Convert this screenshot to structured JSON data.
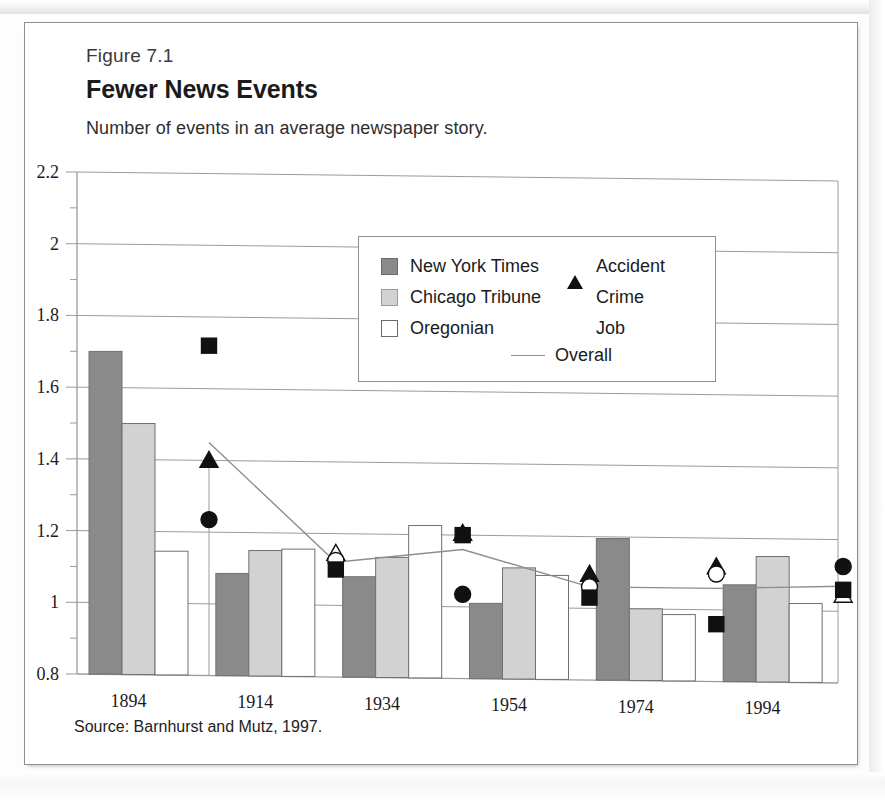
{
  "page": {
    "corner_number": ""
  },
  "figure": {
    "label": "Figure 7.1",
    "title": "Fewer News Events",
    "subtitle": "Number of events in an average newspaper story.",
    "source": "Source: Barnhurst and Mutz, 1997."
  },
  "legend": {
    "items": [
      {
        "label": "New York Times",
        "icon": "square-swatch-dark-gray",
        "color": "#8a8a8a"
      },
      {
        "label": "Chicago Tribune",
        "icon": "square-swatch-light-gray",
        "color": "#d2d2d2"
      },
      {
        "label": "Oregonian",
        "icon": "square-swatch-white",
        "color": "#ffffff"
      },
      {
        "label": "Accident",
        "icon": "triangle-marker",
        "color": "#111111"
      },
      {
        "label": "Crime",
        "icon": "circle-marker",
        "color": "#111111"
      },
      {
        "label": "Job",
        "icon": "square-marker",
        "color": "#111111"
      },
      {
        "label": "Overall",
        "icon": "line-marker",
        "color": "#8d8d8d"
      }
    ]
  },
  "chart_data": {
    "type": "bar",
    "title": "Fewer News Events",
    "subtitle": "Number of events in an average newspaper story.",
    "xlabel": "",
    "ylabel": "",
    "ylim": [
      0.8,
      2.2
    ],
    "ytick_step": 0.2,
    "yticks": [
      "0.8",
      "1",
      "1.2",
      "1.4",
      "1.6",
      "1.8",
      "2",
      "2.2"
    ],
    "ytick_values": [
      0.8,
      1.0,
      1.2,
      1.4,
      1.6,
      1.8,
      2.0,
      2.2
    ],
    "minor_tick_step": 0.1,
    "grid": "horizontal",
    "legend_position": "inside-top-center",
    "categories": [
      "1894",
      "1914",
      "1934",
      "1954",
      "1974",
      "1994"
    ],
    "series": [
      {
        "name": "New York Times",
        "type": "bar",
        "color": "#8a8a8a",
        "values": [
          1.7,
          1.085,
          1.08,
          1.01,
          1.195,
          1.07
        ]
      },
      {
        "name": "Chicago Tribune",
        "type": "bar",
        "color": "#d2d2d2",
        "values": [
          1.5,
          1.15,
          1.135,
          1.11,
          1.0,
          1.15
        ]
      },
      {
        "name": "Oregonian",
        "type": "bar",
        "color": "#ffffff",
        "values": [
          1.145,
          1.155,
          1.225,
          1.09,
          0.985,
          1.02
        ]
      },
      {
        "name": "Accident",
        "type": "marker",
        "marker": "triangle",
        "filled": [
          true,
          false,
          true,
          true,
          true,
          false
        ],
        "values": [
          1.4,
          1.145,
          1.205,
          1.095,
          1.12,
          1.045
        ]
      },
      {
        "name": "Crime",
        "type": "marker",
        "marker": "circle",
        "filled": [
          true,
          false,
          true,
          false,
          false,
          true
        ],
        "values": [
          1.235,
          1.125,
          1.035,
          1.06,
          1.1,
          1.125
        ]
      },
      {
        "name": "Job",
        "type": "marker",
        "marker": "square",
        "filled": [
          true,
          true,
          true,
          true,
          true,
          true
        ],
        "values": [
          1.72,
          1.1,
          1.2,
          1.03,
          0.96,
          1.06
        ]
      },
      {
        "name": "Overall",
        "type": "line",
        "color": "#8d8d8d",
        "values": [
          1.45,
          1.12,
          1.16,
          1.06,
          1.06,
          1.07
        ]
      }
    ]
  }
}
